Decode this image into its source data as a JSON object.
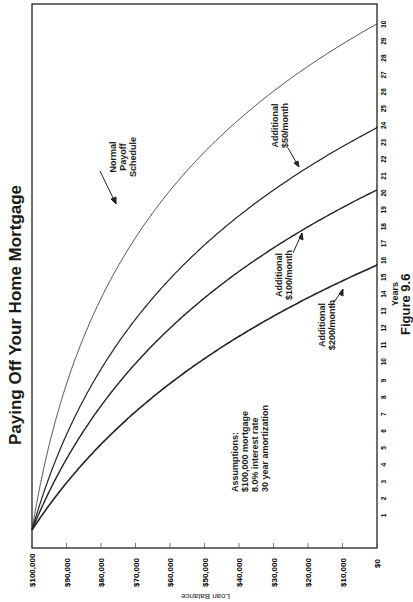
{
  "chart_data": {
    "type": "line",
    "title": "Paying Off Your Home Mortgage",
    "figure_label": "Figure 9.6",
    "xlabel": "Years",
    "ylabel": "Loan Balance",
    "orientation_note": "rotated 90 degrees counter-clockwise",
    "x_ticks": [
      1,
      2,
      3,
      4,
      5,
      6,
      7,
      8,
      9,
      10,
      11,
      12,
      13,
      14,
      15,
      16,
      17,
      18,
      19,
      20,
      21,
      22,
      23,
      24,
      25,
      26,
      27,
      28,
      29,
      30
    ],
    "y_ticks": [
      "$100,000",
      "$90,000",
      "$80,000",
      "$70,000",
      "$60,000",
      "$50,000",
      "$40,000",
      "$30,000",
      "$20,000",
      "$10,000",
      "$0"
    ],
    "xlim": [
      0,
      30
    ],
    "ylim": [
      0,
      100000
    ],
    "grid": false,
    "x": [
      0,
      5,
      10,
      15,
      20,
      25,
      30
    ],
    "series": [
      {
        "name": "Normal Payoff Schedule",
        "values": [
          100000,
          95069,
          87724,
          76781,
          60480,
          36191,
          0
        ],
        "stroke": 0.8
      },
      {
        "name": "Additional $50/month",
        "values": [
          100000,
          91412,
          78621,
          59566,
          31181,
          0,
          null
        ],
        "stroke": 1.2,
        "payoff_year": 24
      },
      {
        "name": "Additional $100/month",
        "values": [
          100000,
          87756,
          69517,
          42351,
          1881,
          null,
          null
        ],
        "stroke": 1.4,
        "payoff_year": 20.1
      },
      {
        "name": "Additional $200/month",
        "values": [
          100000,
          80443,
          51311,
          7913,
          null,
          null,
          null
        ],
        "stroke": 1.6,
        "payoff_year": 15.6
      }
    ],
    "annotations": [
      {
        "text": "Normal Payoff Schedule",
        "target": "Normal Payoff Schedule"
      },
      {
        "text": "Additional $50/month",
        "target": "Additional $50/month"
      },
      {
        "text": "Additional $100/month",
        "target": "Additional $100/month"
      },
      {
        "text": "Additional $200/month",
        "target": "Additional $200/month"
      },
      {
        "text": "Assumptions: $100,000 mortgage 8.0% interest rate 30 year amortization"
      }
    ]
  },
  "labels": {
    "title": "Paying Off Your Home Mortgage",
    "figure": "Figure 9.6",
    "years": "Years",
    "loan_balance": "Loan Balance",
    "normal": [
      "Normal",
      "Payoff",
      "Schedule"
    ],
    "add50": [
      "Additional",
      "$50/month"
    ],
    "add100": [
      "Additional",
      "$100/month"
    ],
    "add200": [
      "Additional",
      "$200/month"
    ],
    "assumptions": [
      "Assumptions:",
      "$100,000 mortgage",
      "8.0% interest rate",
      "30 year amortization"
    ]
  }
}
